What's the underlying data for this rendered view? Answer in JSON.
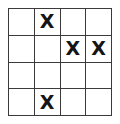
{
  "figure": {
    "type": "grid",
    "rows": 4,
    "columns": 4,
    "mark_symbol": "X",
    "empty_symbol": "",
    "border_color": "#3a3a3a",
    "mark_color": "#151515",
    "cell_background": "#ffffff",
    "page_background": "#ffffff",
    "marked_cells": [
      {
        "row": 1,
        "column": 2
      },
      {
        "row": 2,
        "column": 3
      },
      {
        "row": 2,
        "column": 4
      },
      {
        "row": 4,
        "column": 2
      }
    ],
    "cells": [
      [
        "",
        "X",
        "",
        ""
      ],
      [
        "",
        "",
        "X",
        "X"
      ],
      [
        "",
        "",
        "",
        ""
      ],
      [
        "",
        "X",
        "",
        ""
      ]
    ]
  }
}
